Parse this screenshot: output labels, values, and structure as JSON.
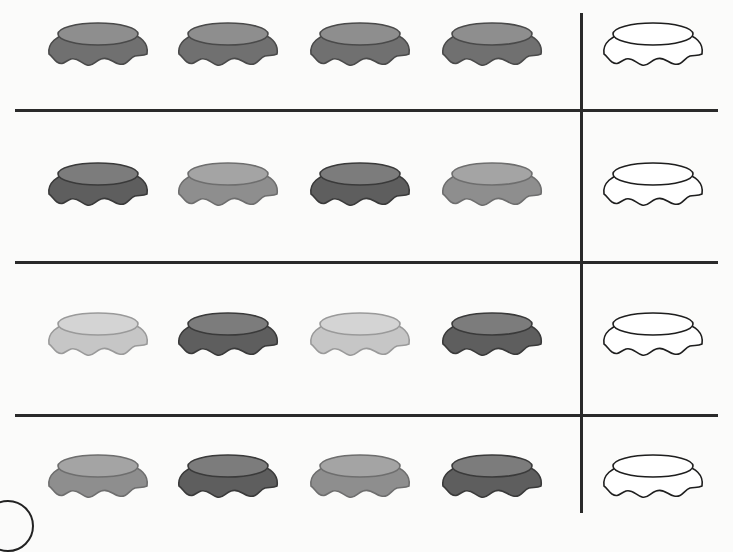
{
  "worksheet": {
    "title": "Continue the pattern",
    "colors": {
      "dark": {
        "top": "#7c7c7c",
        "skirt": "#5e5e5e",
        "stroke": "#3a3a3a"
      },
      "medium": {
        "top": "#a4a4a4",
        "skirt": "#8e8e8e",
        "stroke": "#6e6e6e"
      },
      "light": {
        "top": "#d4d4d4",
        "skirt": "#c6c6c6",
        "stroke": "#9a9a9a"
      },
      "blank": {
        "top": "#ffffff",
        "skirt": "#ffffff",
        "stroke": "#1e1e1e"
      },
      "line": "#2a2a2a"
    },
    "rows": [
      {
        "index": 1,
        "pattern": [
          "medium-dark",
          "medium-dark",
          "medium-dark",
          "medium-dark"
        ],
        "answer_slot": "blank"
      },
      {
        "index": 2,
        "pattern": [
          "dark",
          "medium",
          "dark",
          "medium"
        ],
        "answer_slot": "blank"
      },
      {
        "index": 3,
        "pattern": [
          "light",
          "dark",
          "light",
          "dark"
        ],
        "answer_slot": "blank"
      },
      {
        "index": 4,
        "pattern": [
          "medium",
          "dark",
          "medium",
          "dark"
        ],
        "answer_slot": "blank"
      }
    ]
  }
}
